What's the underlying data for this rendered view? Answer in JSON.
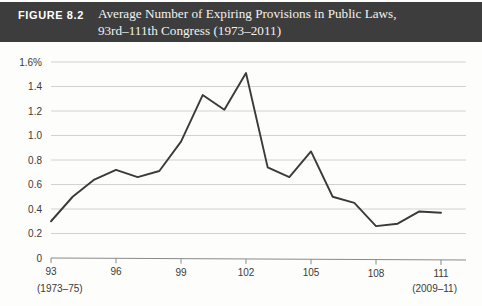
{
  "banner": {
    "figure_label": "FIGURE 8.2",
    "title_line1": "Average Number of Expiring Provisions in Public Laws,",
    "title_line2": "93rd–111th Congress (1973–2011)",
    "background_color": "#3d3d3d",
    "text_color": "#f2f2f0"
  },
  "chart_data": {
    "type": "line",
    "title": "Average Number of Expiring Provisions in Public Laws, 93rd–111th Congress (1973–2011)",
    "xlabel": "",
    "ylabel": "",
    "categories": [
      "93",
      "94",
      "95",
      "96",
      "97",
      "98",
      "99",
      "100",
      "101",
      "102",
      "103",
      "104",
      "105",
      "106",
      "107",
      "108",
      "109",
      "110",
      "111"
    ],
    "x": [
      93,
      94,
      95,
      96,
      97,
      98,
      99,
      100,
      101,
      102,
      103,
      104,
      105,
      106,
      107,
      108,
      109,
      110,
      111
    ],
    "values": [
      0.3,
      0.5,
      0.64,
      0.72,
      0.66,
      0.71,
      0.95,
      1.33,
      1.21,
      1.51,
      0.74,
      0.66,
      0.87,
      0.5,
      0.45,
      0.26,
      0.28,
      0.38,
      0.37
    ],
    "series": [
      {
        "name": "Average number of expiring provisions",
        "values": [
          0.3,
          0.5,
          0.64,
          0.72,
          0.66,
          0.71,
          0.95,
          1.33,
          1.21,
          1.51,
          0.74,
          0.66,
          0.87,
          0.5,
          0.45,
          0.26,
          0.28,
          0.38,
          0.37
        ],
        "color": "#3a3a3a"
      }
    ],
    "ylim": [
      0,
      1.6
    ],
    "xlim": [
      93,
      111
    ],
    "ytick_labels": [
      "0",
      "0.2",
      "0.4",
      "0.6",
      "0.8",
      "1.0",
      "1.2",
      "1.4",
      "1.6%"
    ],
    "ytick_values": [
      0,
      0.2,
      0.4,
      0.6,
      0.8,
      1.0,
      1.2,
      1.4,
      1.6
    ],
    "xtick_labels": [
      "93",
      "96",
      "99",
      "102",
      "105",
      "108",
      "111"
    ],
    "xtick_values": [
      93,
      96,
      99,
      102,
      105,
      108,
      111
    ],
    "xtick_sublabels": [
      {
        "tick": "93",
        "text": "(1973–75)"
      },
      {
        "tick": "111",
        "text": "(2009–11)"
      }
    ],
    "grid": true,
    "grid_color": "#d2d2d2",
    "legend": "none",
    "line_color": "#3a3a3a",
    "background_color": "#fdfdfb"
  }
}
